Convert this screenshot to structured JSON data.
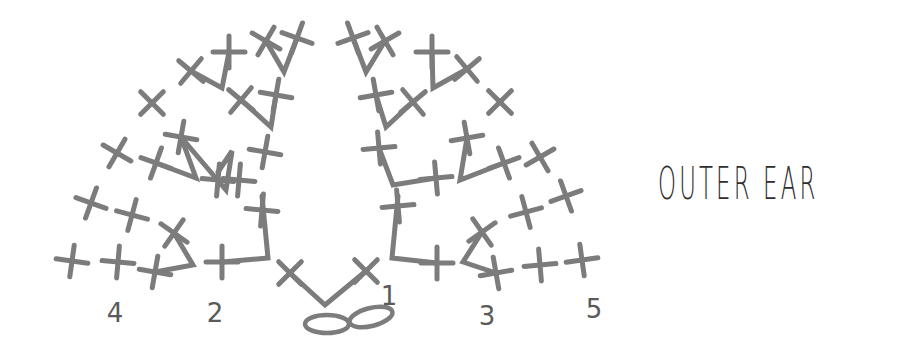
{
  "title": "OUTER EAR",
  "colors": {
    "stitch": "#7c7c7c",
    "title": "#2e2e2e",
    "numbers": "#5a5a5a",
    "background": "#ffffff"
  },
  "row_numbers": [
    {
      "label": "4",
      "x": 115,
      "y": 322
    },
    {
      "label": "2",
      "x": 215,
      "y": 322
    },
    {
      "label": "1",
      "x": 389,
      "y": 305
    },
    {
      "label": "3",
      "x": 487,
      "y": 325
    },
    {
      "label": "5",
      "x": 594,
      "y": 318
    }
  ],
  "legend": {
    "symbols": [
      "single-crochet (+ / x)",
      "chain (oval loop)",
      "increase (V)"
    ]
  },
  "stitches": {
    "chain_loops": [
      {
        "cx": 327,
        "cy": 324,
        "rx": 22,
        "ry": 9,
        "rot": 0
      },
      {
        "cx": 371,
        "cy": 317,
        "rx": 22,
        "ry": 9,
        "rot": -14
      }
    ],
    "crosses": [
      {
        "x": 290,
        "y": 273,
        "r": 45
      },
      {
        "x": 366,
        "y": 271,
        "r": 45
      },
      {
        "x": 262,
        "y": 210,
        "r": 5
      },
      {
        "x": 222,
        "y": 262,
        "r": 0
      },
      {
        "x": 174,
        "y": 233,
        "r": 35
      },
      {
        "x": 155,
        "y": 272,
        "r": 10
      },
      {
        "x": 118,
        "y": 262,
        "r": 5
      },
      {
        "x": 72,
        "y": 261,
        "r": 8
      },
      {
        "x": 132,
        "y": 215,
        "r": 15
      },
      {
        "x": 91,
        "y": 203,
        "r": 20
      },
      {
        "x": 398,
        "y": 206,
        "r": -5
      },
      {
        "x": 437,
        "y": 263,
        "r": 0
      },
      {
        "x": 482,
        "y": 232,
        "r": -35
      },
      {
        "x": 496,
        "y": 273,
        "r": -10
      },
      {
        "x": 540,
        "y": 265,
        "r": -5
      },
      {
        "x": 582,
        "y": 260,
        "r": -8
      },
      {
        "x": 526,
        "y": 212,
        "r": -15
      },
      {
        "x": 566,
        "y": 196,
        "r": -20
      },
      {
        "x": 218,
        "y": 180,
        "r": 5
      },
      {
        "x": 156,
        "y": 163,
        "r": 20
      },
      {
        "x": 181,
        "y": 137,
        "r": 10
      },
      {
        "x": 117,
        "y": 153,
        "r": 30
      },
      {
        "x": 265,
        "y": 152,
        "r": 10
      },
      {
        "x": 239,
        "y": 180,
        "r": 5
      },
      {
        "x": 379,
        "y": 148,
        "r": -5
      },
      {
        "x": 436,
        "y": 178,
        "r": -5
      },
      {
        "x": 467,
        "y": 138,
        "r": -10
      },
      {
        "x": 504,
        "y": 163,
        "r": -20
      },
      {
        "x": 540,
        "y": 157,
        "r": -30
      },
      {
        "x": 152,
        "y": 103,
        "r": 45
      },
      {
        "x": 191,
        "y": 71,
        "r": 40
      },
      {
        "x": 229,
        "y": 52,
        "r": 0
      },
      {
        "x": 266,
        "y": 41,
        "r": 30
      },
      {
        "x": 297,
        "y": 38,
        "r": 20
      },
      {
        "x": 241,
        "y": 100,
        "r": 40
      },
      {
        "x": 276,
        "y": 95,
        "r": 10
      },
      {
        "x": 353,
        "y": 38,
        "r": -20
      },
      {
        "x": 385,
        "y": 41,
        "r": -30
      },
      {
        "x": 432,
        "y": 52,
        "r": 0
      },
      {
        "x": 467,
        "y": 69,
        "r": -40
      },
      {
        "x": 500,
        "y": 102,
        "r": -45
      },
      {
        "x": 376,
        "y": 95,
        "r": -10
      },
      {
        "x": 413,
        "y": 102,
        "r": -40
      }
    ],
    "lines": [
      {
        "pts": "290,273 325,305 366,271"
      },
      {
        "pts": "262,196 268,258 222,262"
      },
      {
        "pts": "174,233 193,265 155,272"
      },
      {
        "pts": "398,196 392,258 437,263"
      },
      {
        "pts": "482,232 463,262 496,273"
      },
      {
        "pts": "218,172 232,151 226,190 181,137"
      },
      {
        "pts": "156,163 196,178 181,137"
      },
      {
        "pts": "379,148 393,185 436,178"
      },
      {
        "pts": "467,138 460,180 504,163"
      },
      {
        "pts": "191,71 222,88 229,52"
      },
      {
        "pts": "266,41 284,72 297,38"
      },
      {
        "pts": "241,100 271,127 276,95"
      },
      {
        "pts": "353,38 366,72 385,41"
      },
      {
        "pts": "432,52 433,88 467,69"
      },
      {
        "pts": "376,95 386,127 413,102"
      }
    ]
  }
}
